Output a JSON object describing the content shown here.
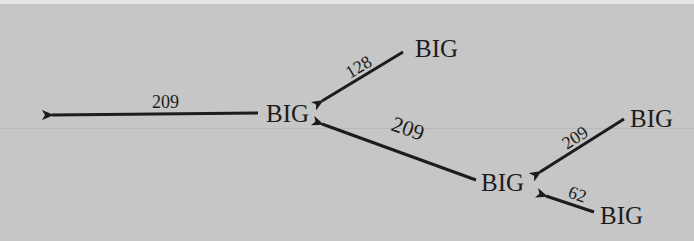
{
  "diagram": {
    "type": "tree",
    "background": "#c6c6c6",
    "nodes": [
      {
        "id": "n0",
        "label": "BIG"
      },
      {
        "id": "n1",
        "label": "BIG"
      },
      {
        "id": "n2",
        "label": "BIG"
      },
      {
        "id": "n3",
        "label": "BIG"
      },
      {
        "id": "n4",
        "label": "BIG"
      }
    ],
    "edges": [
      {
        "from": "n0",
        "to": "out",
        "label": "209"
      },
      {
        "from": "n1",
        "to": "n0",
        "label": "128"
      },
      {
        "from": "n2",
        "to": "n0",
        "label": "209"
      },
      {
        "from": "n3",
        "to": "n2",
        "label": "209"
      },
      {
        "from": "n4",
        "to": "n2",
        "label": "62"
      }
    ]
  }
}
